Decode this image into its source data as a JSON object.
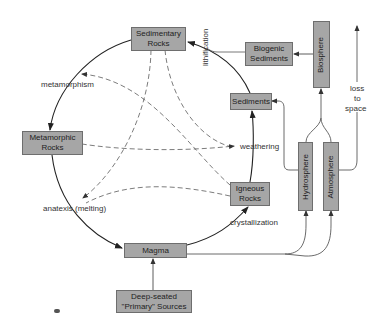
{
  "diagram": {
    "nodes": {
      "sedimentary_rocks": {
        "line1": "Sedimentary",
        "line2": "Rocks"
      },
      "biogenic_sediments": {
        "line1": "Biogenic",
        "line2": "Sediments"
      },
      "biosphere": {
        "label": "Biosphere"
      },
      "sediments": {
        "label": "Sediments"
      },
      "hydrosphere": {
        "label": "Hydrosphere"
      },
      "atmosphere": {
        "label": "Atmosphere"
      },
      "metamorphic_rocks": {
        "line1": "Metamorphic",
        "line2": "Rocks"
      },
      "igneous_rocks": {
        "line1": "Igneous",
        "line2": "Rocks"
      },
      "magma": {
        "label": "Magma"
      },
      "deep_sources": {
        "line1": "Deep-seated",
        "line2": "\"Primary\" Sources"
      }
    },
    "edge_labels": {
      "lithification": "lithification",
      "metamorphism": "metamorphism",
      "weathering": "weathering",
      "anatexis": "anatexis (melting)",
      "crystallization": "crystallization",
      "loss": "loss",
      "to": "to",
      "space": "space"
    },
    "colors": {
      "box_fill": "#a6a6a6",
      "box_border": "#6e6e6e",
      "line": "#222222"
    }
  }
}
